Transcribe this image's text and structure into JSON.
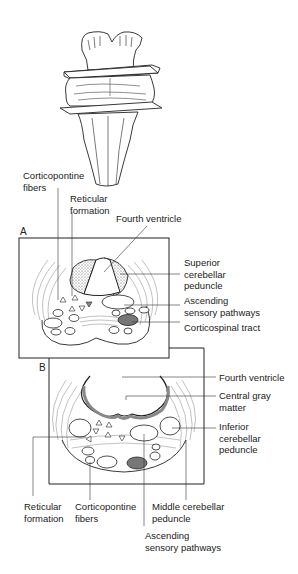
{
  "figure": {
    "top_view": "Brainstem with two section planes"
  },
  "panels": {
    "A": {
      "letter": "A",
      "labels": {
        "corticopontine_fibers": "Corticopontine\nfibers",
        "reticular_formation": "Reticular\nformation",
        "fourth_ventricle": "Fourth ventricle",
        "superior_cerebellar_peduncle": "Superior\ncerebellar\npeduncle",
        "ascending_sensory_pathways": "Ascending\nsensory pathways",
        "corticospinal_tract": "Corticospinal tract"
      }
    },
    "B": {
      "letter": "B",
      "labels": {
        "fourth_ventricle": "Fourth ventricle",
        "central_gray_matter": "Central gray\nmatter",
        "inferior_cerebellar_peduncle": "Inferior\ncerebellar\npeduncle",
        "reticular_formation": "Reticular\nformation",
        "corticopontine_fibers": "Corticopontine\nfibers",
        "middle_cerebellar_peduncle": "Middle cerebellar\npeduncle",
        "ascending_sensory_pathways": "Ascending\nsensory pathways"
      }
    }
  },
  "colors": {
    "line": "#222222",
    "stipple": "#9a9a9a",
    "tract_fill": "#777777",
    "background": "#ffffff"
  }
}
